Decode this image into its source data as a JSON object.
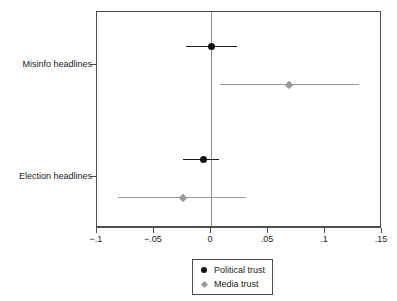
{
  "chart_data": {
    "type": "scatter",
    "subtype": "coefficient-plot-with-confidence-intervals",
    "title": "",
    "subtitle": "",
    "xlabel": "",
    "ylabel": "",
    "xlim": [
      -0.1,
      0.15
    ],
    "ylim": [
      0,
      1
    ],
    "grid": false,
    "zero_reference_line": 0,
    "legend_position": "bottom-center",
    "x_ticks": [
      {
        "value": -0.1,
        "label": "−.1"
      },
      {
        "value": -0.05,
        "label": "−.05"
      },
      {
        "value": 0,
        "label": "0"
      },
      {
        "value": 0.05,
        "label": ".05"
      },
      {
        "value": 0.1,
        "label": ".1"
      },
      {
        "value": 0.15,
        "label": ".15"
      }
    ],
    "categories": [
      "Misinfo headlines",
      "Election headlines"
    ],
    "y_tick_labels": [
      {
        "label": "Misinfo headlines",
        "value": 0.72
      },
      {
        "label": "Election headlines",
        "value": 0.24
      }
    ],
    "series": [
      {
        "name": "Political trust",
        "marker": "circle",
        "color": "#111111",
        "points": [
          {
            "category": "Misinfo headlines",
            "estimate": 0.0,
            "ci_low": -0.022,
            "ci_high": 0.023
          },
          {
            "category": "Election headlines",
            "estimate": -0.007,
            "ci_low": -0.025,
            "ci_high": 0.007
          }
        ]
      },
      {
        "name": "Media trust",
        "marker": "diamond",
        "color": "#9a9a9a",
        "points": [
          {
            "category": "Misinfo headlines",
            "estimate": 0.068,
            "ci_low": 0.008,
            "ci_high": 0.13
          },
          {
            "category": "Election headlines",
            "estimate": -0.025,
            "ci_low": -0.082,
            "ci_high": 0.031
          }
        ]
      }
    ],
    "legend": [
      {
        "label": "Political trust",
        "marker": "circle",
        "color": "#111111"
      },
      {
        "label": "Media trust",
        "marker": "diamond",
        "color": "#9a9a9a"
      }
    ]
  }
}
